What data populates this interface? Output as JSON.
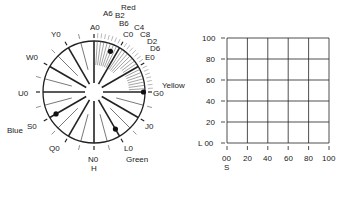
{
  "wheel": {
    "center": [
      94,
      92
    ],
    "radius": 51,
    "hole_radius": 9,
    "hue_labels": [
      {
        "text": "A0",
        "angle": 90
      },
      {
        "text": "C0",
        "angle": 60
      },
      {
        "text": "E0",
        "angle": 30
      },
      {
        "text": "G0",
        "angle": 0
      },
      {
        "text": "J0",
        "angle": -30
      },
      {
        "text": "L0",
        "angle": -60
      },
      {
        "text": "N0",
        "angle": -90
      },
      {
        "text": "Q0",
        "angle": -120
      },
      {
        "text": "S0",
        "angle": -150
      },
      {
        "text": "U0",
        "angle": 180
      },
      {
        "text": "W0",
        "angle": 150
      },
      {
        "text": "Y0",
        "angle": 120
      }
    ],
    "fine_labels": [
      "A6",
      "B2",
      "B6",
      "C4",
      "C8",
      "D2",
      "D6"
    ],
    "color_names": {
      "red": "Red",
      "yellow": "Yellow",
      "green": "Green",
      "blue": "Blue"
    },
    "axis_label": "H",
    "dots": [
      {
        "angle": 68,
        "r": 0.86
      },
      {
        "angle": 0,
        "r": 0.97
      },
      {
        "angle": -60,
        "r": 0.84
      },
      {
        "angle": -150,
        "r": 0.86
      }
    ]
  },
  "grid": {
    "y_ticks": [
      "100",
      "80",
      "60",
      "40",
      "20",
      "L 00"
    ],
    "x_ticks": [
      "00",
      "20",
      "40",
      "60",
      "80",
      "100"
    ],
    "x_label": "S"
  }
}
